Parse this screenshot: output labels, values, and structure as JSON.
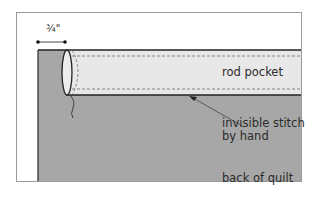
{
  "diagram": {
    "type": "quilting illustration",
    "dimension_label": "¾\"",
    "labels": {
      "rod_pocket": "rod pocket",
      "stitch_line1": "invisible stitch",
      "stitch_line2": "by hand",
      "back_of_quilt": "back of quilt"
    },
    "colors": {
      "frame_border": "#9a9a9a",
      "quilt_fill": "#a7a7a7",
      "pocket_fill": "#e8e8e8",
      "outline": "#222222",
      "dashed_stitch": "#6a6a6a",
      "text": "#2b2b2b"
    }
  }
}
